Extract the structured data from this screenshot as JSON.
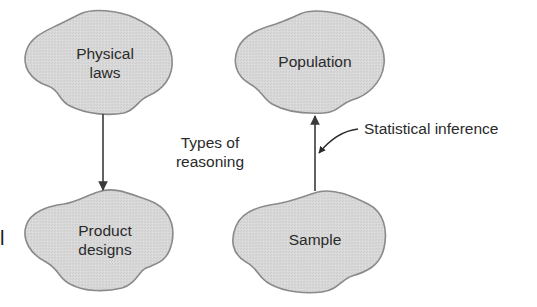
{
  "diagram": {
    "type": "concept-diagram",
    "edge_fragment": "l",
    "nodes": {
      "physical_laws": {
        "label_line1": "Physical",
        "label_line2": "laws"
      },
      "product_designs": {
        "label_line1": "Product",
        "label_line2": "designs"
      },
      "population": {
        "label": "Population"
      },
      "sample": {
        "label": "Sample"
      }
    },
    "center_label": {
      "line1": "Types of",
      "line2": "reasoning"
    },
    "annotation": {
      "text": "Statistical inference"
    },
    "edges": [
      {
        "from": "Physical laws",
        "to": "Product designs",
        "direction": "down"
      },
      {
        "from": "Sample",
        "to": "Population",
        "direction": "up",
        "label": "Statistical inference"
      }
    ],
    "colors": {
      "blob_fill": "#d6d6d6",
      "blob_stroke": "#8a8a8a",
      "arrow": "#3a3a3a",
      "text": "#2a2a2a"
    }
  }
}
